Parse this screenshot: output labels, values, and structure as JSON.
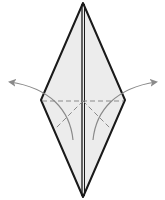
{
  "diagram": {
    "type": "origami-fold-step",
    "colors": {
      "paper_fill": "#e8e8e8",
      "outline": "#1a1a1a",
      "fold_line": "#8a8a8a",
      "arrow": "#8a8a8a"
    },
    "elements": [
      {
        "name": "diamond-outline",
        "kind": "shape"
      },
      {
        "name": "center-crease",
        "kind": "line"
      },
      {
        "name": "horizontal-valley-fold",
        "kind": "dashed-line"
      },
      {
        "name": "left-diagonal-valley-fold",
        "kind": "dashed-line"
      },
      {
        "name": "right-diagonal-valley-fold",
        "kind": "dashed-line"
      },
      {
        "name": "left-fold-arrow",
        "kind": "arrow",
        "direction": "up-left"
      },
      {
        "name": "right-fold-arrow",
        "kind": "arrow",
        "direction": "up-right"
      }
    ]
  }
}
